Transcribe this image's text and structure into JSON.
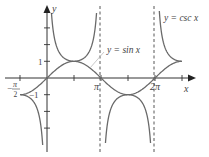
{
  "chart_data": {
    "type": "line",
    "title": "",
    "xlabel": "x",
    "ylabel": "y",
    "xlim": [
      -1.8,
      8.3
    ],
    "ylim": [
      -4.1,
      4.1
    ],
    "x_ticks": [
      {
        "value": -1.5708,
        "label": "-π/2"
      },
      {
        "value": 1.5708,
        "label": ""
      },
      {
        "value": 3.1416,
        "label": "π"
      },
      {
        "value": 4.7124,
        "label": ""
      },
      {
        "value": 6.2832,
        "label": "2π"
      },
      {
        "value": 7.854,
        "label": ""
      }
    ],
    "y_ticks": [
      {
        "value": 1,
        "label": "1"
      },
      {
        "value": -1,
        "label": "-1"
      },
      {
        "value": 2,
        "label": ""
      },
      {
        "value": 3,
        "label": ""
      },
      {
        "value": -2,
        "label": ""
      },
      {
        "value": -3,
        "label": ""
      }
    ],
    "asymptotes": [
      {
        "x": 0,
        "style": "axis"
      },
      {
        "x": 3.1416,
        "style": "dashed"
      },
      {
        "x": 6.2832,
        "style": "dashed"
      }
    ],
    "series": [
      {
        "name": "y = sin x",
        "function": "sin(x)",
        "domain": [
          -1.5708,
          7.854
        ]
      },
      {
        "name": "y = csc x",
        "function": "1/sin(x)",
        "domain": [
          -1.5708,
          7.854
        ]
      }
    ],
    "annotations": [
      {
        "text": "y = sin x",
        "x": 4.1,
        "y": 1.6,
        "leader_to": [
          2.6,
          0.52
        ]
      },
      {
        "text": "y = csc x",
        "x": 6.5,
        "y": 3.6
      }
    ],
    "grid": false,
    "legend": "none"
  },
  "labels": {
    "y_axis": "y",
    "x_axis": "x",
    "one": "1",
    "neg_one": "−1",
    "pi": "π",
    "two_pi": "2π",
    "neg_pi_num": "π",
    "neg_sign": "−",
    "neg_pi_den": "2",
    "sin_label": "y = sin x",
    "csc_label": "y = csc x"
  },
  "colors": {
    "curve": "#6a6a6a",
    "axis": "#333333",
    "leader": "#bbbbbb"
  }
}
